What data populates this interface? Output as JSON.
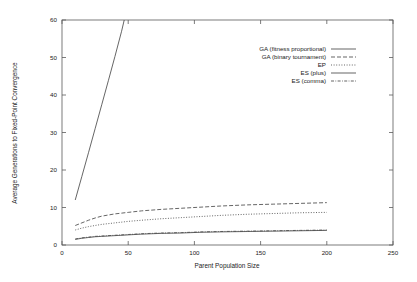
{
  "chart_data": {
    "type": "line",
    "title": "",
    "xlabel": "Parent Population Size",
    "ylabel": "Average Generations to Fixed-Point Convergence",
    "xlim": [
      0,
      250
    ],
    "ylim": [
      0,
      60
    ],
    "xticks": [
      "0",
      "50",
      "100",
      "150",
      "200",
      "250"
    ],
    "xtick_values": [
      0,
      50,
      100,
      150,
      200,
      250
    ],
    "yticks": [
      "0",
      "10",
      "20",
      "30",
      "40",
      "50",
      "60"
    ],
    "ytick_values": [
      0,
      10,
      20,
      30,
      40,
      50,
      60
    ],
    "grid": false,
    "legend_position": "upper right inside",
    "series": [
      {
        "name": "GA (fitness proportional)",
        "dash": "none",
        "x": [
          10,
          15,
          20,
          25,
          30,
          35,
          40,
          45,
          47
        ],
        "values": [
          12.0,
          18.3,
          24.6,
          31.0,
          37.4,
          43.8,
          50.3,
          57.0,
          60.0
        ]
      },
      {
        "name": "GA (binary tournament)",
        "dash": "4,2",
        "x": [
          10,
          15,
          20,
          25,
          30,
          40,
          50,
          60,
          75,
          90,
          105,
          120,
          140,
          160,
          180,
          200
        ],
        "values": [
          5.2,
          5.9,
          6.6,
          7.2,
          7.7,
          8.3,
          8.7,
          9.1,
          9.5,
          9.8,
          10.1,
          10.4,
          10.7,
          10.9,
          11.1,
          11.3
        ]
      },
      {
        "name": "EP",
        "dash": "1,1.6",
        "x": [
          10,
          15,
          20,
          25,
          30,
          40,
          50,
          60,
          75,
          90,
          105,
          120,
          140,
          160,
          180,
          200
        ],
        "values": [
          4.0,
          4.5,
          4.9,
          5.2,
          5.5,
          5.9,
          6.3,
          6.6,
          7.0,
          7.3,
          7.6,
          7.9,
          8.2,
          8.4,
          8.6,
          8.7
        ]
      },
      {
        "name": "ES (plus)",
        "dash": "none",
        "x": [
          10,
          15,
          20,
          25,
          30,
          40,
          50,
          60,
          75,
          90,
          105,
          120,
          140,
          160,
          180,
          200
        ],
        "values": [
          1.5,
          1.8,
          2.0,
          2.2,
          2.3,
          2.5,
          2.7,
          2.9,
          3.1,
          3.2,
          3.4,
          3.5,
          3.6,
          3.7,
          3.8,
          3.9
        ]
      },
      {
        "name": "ES (comma)",
        "dash": "3,1.4,0.8,1.4",
        "x": [
          10,
          15,
          20,
          25,
          30,
          40,
          50,
          60,
          75,
          90,
          105,
          120,
          140,
          160,
          180,
          200
        ],
        "values": [
          1.6,
          1.9,
          2.1,
          2.3,
          2.4,
          2.6,
          2.8,
          3.0,
          3.2,
          3.3,
          3.5,
          3.6,
          3.7,
          3.8,
          3.9,
          4.0
        ]
      }
    ]
  },
  "axes": {
    "xlabel": "Parent Population Size",
    "ylabel": "Average Generations to Fixed-Point Convergence"
  },
  "legend": {
    "items": [
      {
        "label": "GA (fitness proportional)"
      },
      {
        "label": "GA (binary tournament)"
      },
      {
        "label": "EP"
      },
      {
        "label": "ES (plus)"
      },
      {
        "label": "ES (comma)"
      }
    ]
  }
}
